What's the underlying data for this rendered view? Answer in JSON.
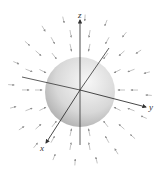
{
  "figure": {
    "colors": {
      "background": "#ffffff",
      "axis": "#333333",
      "arrow": "#9a9a9a",
      "sphere_light": "#f4f4f4",
      "sphere_dark": "#a8a8a8"
    },
    "sphere": {
      "cx": 80,
      "cy": 92,
      "r": 35
    },
    "origin": {
      "x": 80,
      "y": 90
    },
    "axes": [
      {
        "name": "z",
        "label": "z",
        "x2": 80,
        "y2": 20,
        "lx": 78,
        "ly": 18
      },
      {
        "name": "y",
        "label": "y",
        "x2": 146,
        "y2": 107,
        "lx": 149,
        "ly": 110
      },
      {
        "name": "x",
        "label": "x",
        "x2": 46,
        "y2": 143,
        "lx": 40,
        "ly": 151
      }
    ],
    "neg_axes": [
      {
        "x1": 22,
        "y1": 77
      },
      {
        "x1": 109,
        "y1": 48
      },
      {
        "x1": 80,
        "y1": 145
      }
    ],
    "arrow_field": {
      "type": "inward-radial",
      "rings": [
        {
          "radius": 45,
          "count": 14,
          "length": 7
        },
        {
          "radius": 58,
          "count": 18,
          "length": 7
        },
        {
          "radius": 72,
          "count": 20,
          "length": 6
        }
      ]
    }
  }
}
